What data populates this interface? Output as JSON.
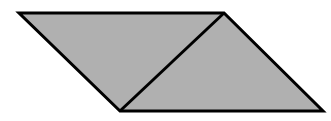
{
  "figure": {
    "name": "parallelogram-divided-into-two-triangles",
    "canvas": {
      "width": 331,
      "height": 121,
      "background_color": "#FFFFFF"
    },
    "style": {
      "fill_color": "#B0B0B0",
      "stroke_color": "#000000",
      "stroke_width": 3,
      "interior_line_color": "#000000",
      "interior_line_width": 3
    },
    "vertices": {
      "top_left": {
        "label": "A",
        "x": 19,
        "y": 13
      },
      "top_right": {
        "label": "B",
        "x": 224,
        "y": 13
      },
      "bottom_left": {
        "label": "C",
        "x": 120,
        "y": 111
      },
      "bottom_right": {
        "label": "D",
        "x": 323,
        "y": 111
      }
    },
    "outline_points": "19,13 224,13 323,111 120,111",
    "diagonal": {
      "name": "interior-diagonal",
      "from_x": 224,
      "from_y": 13,
      "to_x": 120,
      "to_y": 111
    },
    "edges": [
      {
        "name": "top-edge",
        "from": "top_left",
        "to": "top_right"
      },
      {
        "name": "right-edge",
        "from": "top_right",
        "to": "bottom_right"
      },
      {
        "name": "bottom-edge",
        "from": "bottom_right",
        "to": "bottom_left"
      },
      {
        "name": "left-edge",
        "from": "bottom_left",
        "to": "top_left"
      }
    ],
    "labels": {
      "title": "",
      "caption": "",
      "annotations": []
    }
  }
}
